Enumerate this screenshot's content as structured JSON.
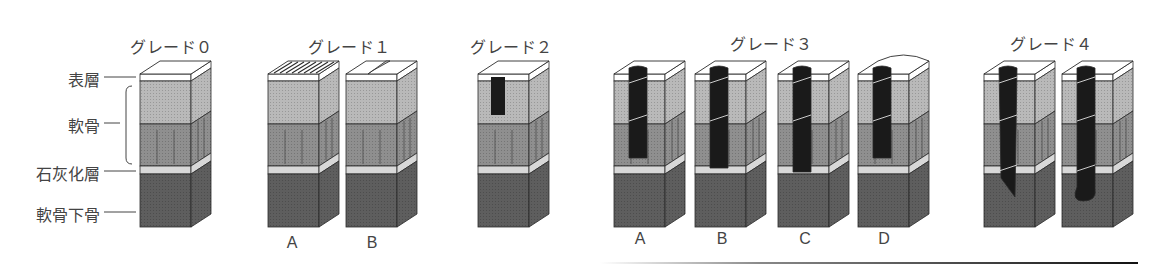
{
  "figure": {
    "layer_labels": [
      {
        "id": "surface",
        "text": "表層",
        "y": 77
      },
      {
        "id": "cartilage",
        "text": "軟骨",
        "y": 123
      },
      {
        "id": "calcified",
        "text": "石灰化層",
        "y": 171
      },
      {
        "id": "subchondral",
        "text": "軟骨下骨",
        "y": 212
      }
    ],
    "grades": [
      {
        "id": "grade0",
        "title": "グレード０",
        "title_x": 130,
        "blocks": [
          {
            "x": 140,
            "type": "intact",
            "variant": ""
          }
        ]
      },
      {
        "id": "grade1",
        "title": "グレード１",
        "title_x": 308,
        "blocks": [
          {
            "x": 268,
            "type": "fibrillation",
            "variant": "A"
          },
          {
            "x": 346,
            "type": "fissure",
            "variant": "B"
          }
        ]
      },
      {
        "id": "grade2",
        "title": "グレード２",
        "title_x": 470,
        "blocks": [
          {
            "x": 478,
            "type": "shallow",
            "variant": ""
          }
        ]
      },
      {
        "id": "grade3",
        "title": "グレード３",
        "title_x": 730,
        "blocks": [
          {
            "x": 614,
            "type": "deep_a",
            "variant": "A"
          },
          {
            "x": 695,
            "type": "deep_b",
            "variant": "B"
          },
          {
            "x": 778,
            "type": "deep_c",
            "variant": "C"
          },
          {
            "x": 858,
            "type": "deep_d",
            "variant": "D"
          }
        ]
      },
      {
        "id": "grade4",
        "title": "グレード４",
        "title_x": 1010,
        "blocks": [
          {
            "x": 984,
            "type": "through_a",
            "variant": ""
          },
          {
            "x": 1062,
            "type": "through_b",
            "variant": ""
          }
        ]
      }
    ],
    "colors": {
      "surface": "#ffffff",
      "cartilage_upper": "#b9b9b9",
      "cartilage_lower": "#8f8f8f",
      "calcified": "#d8d8d8",
      "bone": "#5e5e5e",
      "lesion": "#1a1a1a",
      "outline": "#2a2a2a",
      "text": "#444444"
    }
  }
}
